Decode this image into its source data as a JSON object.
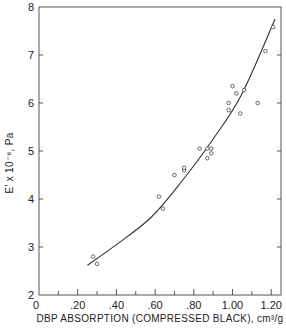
{
  "chart_data": {
    "type": "scatter",
    "title": "",
    "xlabel": "DBP ABSORPTION (COMPRESSED BLACK), cm³/g",
    "ylabel": "E' x 10⁻⁶, Pa",
    "xlim": [
      0,
      1.25
    ],
    "ylim": [
      2,
      8
    ],
    "x_ticks": [
      0,
      0.2,
      0.4,
      0.6,
      0.8,
      1.0,
      1.2
    ],
    "x_tick_labels": [
      "0",
      ".20",
      ".40",
      ".60",
      ".80",
      "1.00",
      "1.20"
    ],
    "x_minor_ticks": [
      0.1,
      0.3,
      0.5,
      0.7,
      0.9,
      1.1
    ],
    "y_ticks": [
      2,
      3,
      4,
      5,
      6,
      7,
      8
    ],
    "y_tick_labels": [
      "2",
      "3",
      "4",
      "5",
      "6",
      "7",
      "8"
    ],
    "grid": false,
    "legend": null,
    "series": [
      {
        "name": "data points",
        "marker": "open-circle",
        "points": [
          {
            "x": 0.28,
            "y": 2.8
          },
          {
            "x": 0.3,
            "y": 2.65
          },
          {
            "x": 0.62,
            "y": 4.05
          },
          {
            "x": 0.64,
            "y": 3.8
          },
          {
            "x": 0.7,
            "y": 4.5
          },
          {
            "x": 0.75,
            "y": 4.6
          },
          {
            "x": 0.75,
            "y": 4.65
          },
          {
            "x": 0.83,
            "y": 5.05
          },
          {
            "x": 0.87,
            "y": 5.05
          },
          {
            "x": 0.89,
            "y": 5.05
          },
          {
            "x": 0.89,
            "y": 4.95
          },
          {
            "x": 0.87,
            "y": 4.85
          },
          {
            "x": 0.98,
            "y": 5.85
          },
          {
            "x": 0.98,
            "y": 6.0
          },
          {
            "x": 1.0,
            "y": 6.35
          },
          {
            "x": 1.02,
            "y": 6.2
          },
          {
            "x": 1.06,
            "y": 6.27
          },
          {
            "x": 1.04,
            "y": 5.78
          },
          {
            "x": 1.13,
            "y": 6.0
          },
          {
            "x": 1.17,
            "y": 7.08
          },
          {
            "x": 1.21,
            "y": 7.58
          }
        ]
      },
      {
        "name": "fitted curve",
        "marker": "line",
        "points": [
          {
            "x": 0.25,
            "y": 2.62
          },
          {
            "x": 0.4,
            "y": 3.05
          },
          {
            "x": 0.58,
            "y": 3.62
          },
          {
            "x": 0.74,
            "y": 4.38
          },
          {
            "x": 0.9,
            "y": 5.25
          },
          {
            "x": 1.05,
            "y": 6.2
          },
          {
            "x": 1.22,
            "y": 7.75
          }
        ]
      }
    ]
  }
}
